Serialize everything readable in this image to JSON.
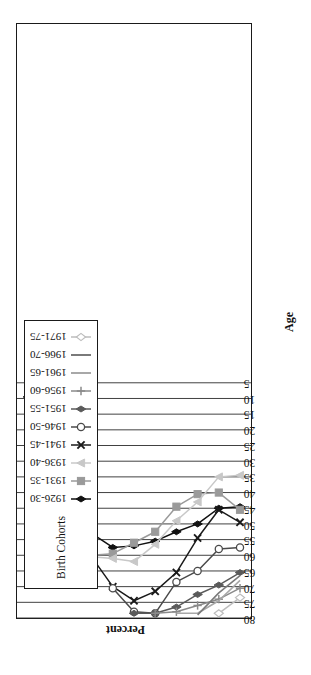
{
  "chart_data": {
    "type": "line",
    "title": "",
    "xlabel": "Age",
    "ylabel": "Percent",
    "grid": "vertical",
    "legend_position": "top-left-inside",
    "legend_title": "Birth Cohorts",
    "categories": [
      "20-24",
      "25-29",
      "30-34",
      "35-39",
      "40-44",
      "45-49",
      "50-54",
      "55-59",
      "60-64",
      "65-69",
      "70-74"
    ],
    "ylim": [
      5,
      80
    ],
    "yticks": [
      80,
      75,
      70,
      65,
      60,
      55,
      50,
      45,
      40,
      35,
      30,
      25,
      20,
      15,
      10,
      5
    ],
    "series": [
      {
        "name": "1926-30",
        "color": "#111111",
        "marker": "diamond-filled",
        "values": [
          44.5,
          45.0,
          50.0,
          52.5,
          55.5,
          57.0,
          57.5,
          53.0,
          38.5,
          18.5,
          9.5
        ]
      },
      {
        "name": "1931-35",
        "color": "#9a9a9a",
        "marker": "square-filled",
        "values": [
          45.5,
          40.0,
          40.5,
          44.5,
          52.5,
          56.0,
          59.5,
          60.0,
          39.0,
          18.5,
          null
        ]
      },
      {
        "name": "1936-40",
        "color": "#c8c8c8",
        "marker": "triangle-filled",
        "values": [
          34.5,
          35.0,
          43.0,
          49.0,
          56.5,
          62.0,
          61.0,
          60.5,
          null,
          null,
          null
        ]
      },
      {
        "name": "1941-45",
        "color": "#1a1a1a",
        "marker": "x-cross",
        "values": [
          49.5,
          45.5,
          54.5,
          65.5,
          71.5,
          74.5,
          70.0,
          60.5,
          null,
          null,
          null
        ]
      },
      {
        "name": "1946-50",
        "color": "#4a4a4a",
        "marker": "circle-open",
        "values": [
          57.5,
          58.0,
          65.0,
          68.5,
          78.5,
          78.0,
          70.5,
          null,
          null,
          null,
          null
        ]
      },
      {
        "name": "1951-55",
        "color": "#5a5a5a",
        "marker": "diamond-filled-dark",
        "values": [
          65.5,
          69.5,
          72.5,
          76.5,
          78.5,
          78.5,
          null,
          null,
          null,
          null,
          null
        ]
      },
      {
        "name": "1956-60",
        "color": "#8a8a8a",
        "marker": "plus",
        "values": [
          70.5,
          74.0,
          76.0,
          78.0,
          78.5,
          null,
          null,
          null,
          null,
          null,
          null
        ]
      },
      {
        "name": "1961-65",
        "color": "#a8a8a8",
        "marker": "line-only",
        "values": [
          68.0,
          74.5,
          78.5,
          78.5,
          null,
          null,
          null,
          null,
          null,
          null,
          null
        ]
      },
      {
        "name": "1966-70",
        "color": "#7a7a7a",
        "marker": "line-only",
        "values": [
          66.5,
          72.0,
          79.0,
          null,
          null,
          null,
          null,
          null,
          null,
          null,
          null
        ]
      },
      {
        "name": "1971-75",
        "color": "#bdbdbd",
        "marker": "diamond-open",
        "values": [
          73.5,
          78.5,
          null,
          null,
          null,
          null,
          null,
          null,
          null,
          null,
          null
        ]
      }
    ]
  }
}
